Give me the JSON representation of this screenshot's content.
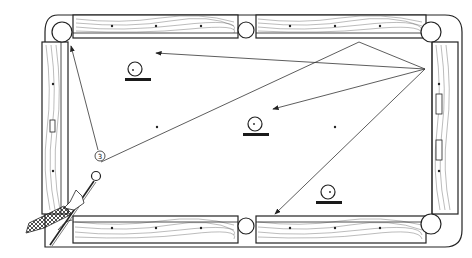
{
  "diagram": {
    "colors": {
      "ink": "#222222",
      "background": "#ffffff"
    },
    "shot_label": "3",
    "elements": [
      {
        "id": "cue-ball",
        "label": "cue ball"
      },
      {
        "id": "object-ball-1",
        "label": "ball near top-left"
      },
      {
        "id": "object-ball-2",
        "label": "ball center"
      },
      {
        "id": "object-ball-3",
        "label": "ball lower-right"
      },
      {
        "id": "cue-stick",
        "label": "cue stick with player's hand"
      }
    ],
    "shot_paths": [
      {
        "from": "cue ball",
        "to": "top rail",
        "note": "line from cue ball to top rail near right side pocket"
      },
      {
        "from": "top rail",
        "to": "right rail",
        "note": "rebound to right rail"
      },
      {
        "from": "right rail",
        "to": "top-left area",
        "note": "arrow toward top-left"
      },
      {
        "from": "right rail",
        "to": "center ball",
        "note": "arrow toward center ball"
      },
      {
        "from": "right rail",
        "to": "bottom rail",
        "note": "arrow toward bottom rail"
      },
      {
        "from": "label 3",
        "to": "top-left pocket",
        "note": "arrow to top-left corner pocket"
      }
    ]
  }
}
